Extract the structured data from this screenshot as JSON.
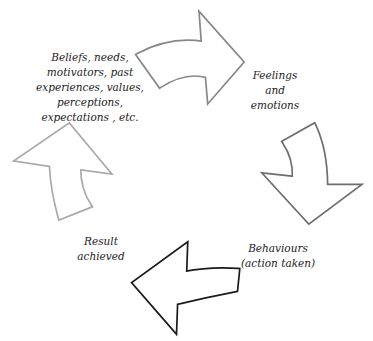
{
  "diagram": {
    "type": "cycle",
    "stages": [
      {
        "id": "beliefs",
        "lines": [
          "Beliefs, needs,",
          "motivators, past",
          "experiences, values,",
          "perceptions,",
          "expectations ,  etc."
        ]
      },
      {
        "id": "feelings",
        "lines": [
          "Feelings",
          "and",
          "emotions"
        ]
      },
      {
        "id": "behaviours",
        "lines": [
          "Behaviours",
          "(action taken)"
        ]
      },
      {
        "id": "result",
        "lines": [
          "Result",
          "achieved"
        ]
      }
    ],
    "arrows": [
      {
        "id": "beliefs-to-feelings",
        "direction": "right",
        "color": "#8a8a8a"
      },
      {
        "id": "feelings-to-behaviours",
        "direction": "down",
        "color": "#6e6e6e"
      },
      {
        "id": "behaviours-to-result",
        "direction": "left",
        "color": "#1a1a1a"
      },
      {
        "id": "result-to-beliefs",
        "direction": "up",
        "color": "#a8a8a8"
      }
    ]
  }
}
